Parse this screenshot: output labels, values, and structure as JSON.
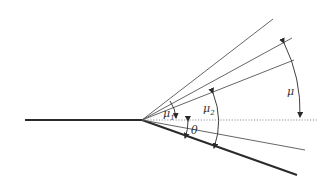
{
  "diagram": {
    "type": "expansion-fan-geometry",
    "labels": {
      "mu": "μ",
      "mu1": "μ",
      "mu1_sub": "1",
      "mu2": "μ",
      "mu2_sub": "2",
      "theta": "θ"
    },
    "colors": {
      "line": "#2a2a2a",
      "thin_line": "#555555",
      "dotted": "#777777",
      "background": "#ffffff"
    }
  }
}
